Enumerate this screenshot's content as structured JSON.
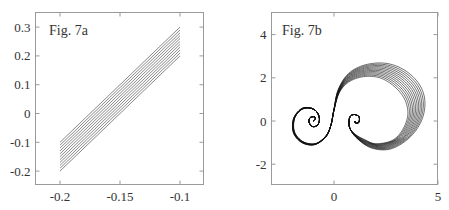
{
  "chart_data": [
    {
      "type": "line",
      "title": "Fig. 7a",
      "xlabel": "",
      "ylabel": "",
      "xlim": [
        -0.22,
        -0.08
      ],
      "ylim": [
        -0.25,
        0.35
      ],
      "grid": false,
      "legend": null,
      "xticks": [
        -0.2,
        -0.15,
        -0.1
      ],
      "xtick_labels": [
        "-0.2",
        "-0.15",
        "-0.1"
      ],
      "yticks": [
        -0.2,
        -0.1,
        0,
        0.1,
        0.2,
        0.3
      ],
      "ytick_labels": [
        "-0.2",
        "-0.1",
        "0",
        "0.1",
        "0.2",
        "0.3"
      ],
      "description": "Family of 11 parallel straight lines, each from x=-0.2 to x=-0.1 with slope 3; offsets step 0.01",
      "series": [
        {
          "name": "line 1",
          "x": [
            -0.2,
            -0.1
          ],
          "y": [
            -0.2,
            0.2
          ]
        },
        {
          "name": "line 2",
          "x": [
            -0.2,
            -0.1
          ],
          "y": [
            -0.19,
            0.21
          ]
        },
        {
          "name": "line 3",
          "x": [
            -0.2,
            -0.1
          ],
          "y": [
            -0.18,
            0.22
          ]
        },
        {
          "name": "line 4",
          "x": [
            -0.2,
            -0.1
          ],
          "y": [
            -0.17,
            0.23
          ]
        },
        {
          "name": "line 5",
          "x": [
            -0.2,
            -0.1
          ],
          "y": [
            -0.16,
            0.24
          ]
        },
        {
          "name": "line 6",
          "x": [
            -0.2,
            -0.1
          ],
          "y": [
            -0.15,
            0.25
          ]
        },
        {
          "name": "line 7",
          "x": [
            -0.2,
            -0.1
          ],
          "y": [
            -0.14,
            0.26
          ]
        },
        {
          "name": "line 8",
          "x": [
            -0.2,
            -0.1
          ],
          "y": [
            -0.13,
            0.27
          ]
        },
        {
          "name": "line 9",
          "x": [
            -0.2,
            -0.1
          ],
          "y": [
            -0.12,
            0.28
          ]
        },
        {
          "name": "line 10",
          "x": [
            -0.2,
            -0.1
          ],
          "y": [
            -0.11,
            0.29
          ]
        },
        {
          "name": "line 11",
          "x": [
            -0.2,
            -0.1
          ],
          "y": [
            -0.1,
            0.3
          ]
        }
      ]
    },
    {
      "type": "line",
      "title": "Fig. 7b",
      "xlabel": "",
      "ylabel": "",
      "xlim": [
        -3,
        5
      ],
      "ylim": [
        -3,
        5
      ],
      "grid": false,
      "legend": null,
      "xticks": [
        0,
        5
      ],
      "xtick_labels": [
        "0",
        "5"
      ],
      "yticks": [
        -2,
        0,
        2,
        4
      ],
      "ytick_labels": [
        "-2",
        "0",
        "2",
        "4"
      ],
      "description": "Family of 12 curves, each spiraling out of (-1,0), crossing upward near the origin, forming a large loop on the right, and spiraling into (1,0). Loop size grows across the family.",
      "curve_count": 12,
      "inner_curve": {
        "x": [
          -1.0,
          -0.9,
          -0.95,
          -1.15,
          -1.2,
          -1.05,
          -0.8,
          -0.7,
          -0.85,
          -1.2,
          -1.6,
          -1.9,
          -1.9,
          -1.5,
          -0.9,
          -0.4,
          -0.15,
          0.0,
          0.25,
          0.7,
          1.4,
          2.2,
          2.9,
          3.4,
          3.55,
          3.3,
          2.8,
          2.0,
          1.45,
          1.0,
          0.75,
          0.75,
          0.95,
          1.2,
          1.2,
          1.05,
          1.0
        ],
        "y": [
          0.0,
          0.1,
          0.2,
          0.15,
          -0.05,
          -0.25,
          -0.2,
          0.1,
          0.45,
          0.6,
          0.5,
          0.1,
          -0.5,
          -0.95,
          -1.05,
          -0.7,
          -0.2,
          0.5,
          1.3,
          1.8,
          2.05,
          2.0,
          1.6,
          1.0,
          0.3,
          -0.4,
          -0.9,
          -1.05,
          -0.85,
          -0.6,
          -0.3,
          0.15,
          0.3,
          0.2,
          -0.05,
          -0.1,
          0.0
        ]
      },
      "outer_curve": {
        "x": [
          -1.0,
          -0.9,
          -0.95,
          -1.15,
          -1.2,
          -1.05,
          -0.8,
          -0.7,
          -0.85,
          -1.2,
          -1.6,
          -1.95,
          -1.95,
          -1.55,
          -0.95,
          -0.4,
          -0.15,
          0.0,
          0.2,
          0.7,
          1.5,
          2.5,
          3.4,
          4.1,
          4.37,
          4.2,
          3.6,
          2.7,
          1.8,
          1.1,
          0.75,
          0.75,
          0.95,
          1.2,
          1.2,
          1.05,
          1.0
        ],
        "y": [
          0.0,
          0.1,
          0.2,
          0.15,
          -0.05,
          -0.25,
          -0.2,
          0.1,
          0.45,
          0.62,
          0.55,
          0.1,
          -0.55,
          -1.0,
          -1.1,
          -0.75,
          -0.2,
          0.55,
          1.45,
          2.2,
          2.6,
          2.67,
          2.35,
          1.7,
          0.9,
          0.0,
          -0.8,
          -1.3,
          -1.25,
          -0.8,
          -0.3,
          0.15,
          0.3,
          0.2,
          -0.05,
          -0.1,
          0.0
        ]
      }
    }
  ],
  "panels": {
    "a": {
      "label": "Fig. 7a"
    },
    "b": {
      "label": "Fig. 7b"
    }
  },
  "colors": {
    "frame": "#9a9a9a",
    "curve": "#111111",
    "text": "#333333"
  }
}
